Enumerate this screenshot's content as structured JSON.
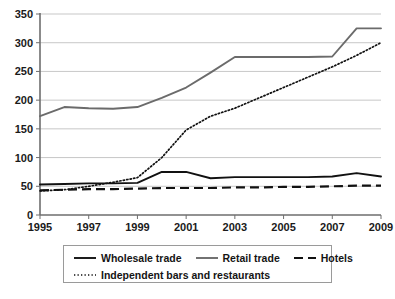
{
  "chart_data": {
    "type": "line",
    "title": "",
    "subtitle": "",
    "xlabel": "",
    "ylabel": "",
    "xlim": [
      1995,
      2009
    ],
    "ylim": [
      0,
      350
    ],
    "grid": true,
    "legend_position": "bottom",
    "x": [
      1995,
      1996,
      1997,
      1998,
      1999,
      2000,
      2001,
      2002,
      2003,
      2004,
      2005,
      2006,
      2007,
      2008,
      2009
    ],
    "y_ticks": [
      0,
      50,
      100,
      150,
      200,
      250,
      300,
      350
    ],
    "x_ticks": [
      1995,
      1997,
      1999,
      2001,
      2003,
      2005,
      2007,
      2009
    ],
    "x_tick_labels": [
      "1995",
      "1997",
      "1999",
      "2001",
      "2003",
      "2005",
      "2007",
      "2009"
    ],
    "y_tick_labels": [
      "0",
      "50",
      "100",
      "150",
      "200",
      "250",
      "300",
      "350"
    ],
    "series": [
      {
        "name": "Wholesale trade",
        "style": "solid",
        "color": "#111111",
        "values": [
          53,
          54,
          55,
          55,
          56,
          75,
          75,
          64,
          66,
          66,
          66,
          66,
          67,
          73,
          67
        ]
      },
      {
        "name": "Retail trade",
        "style": "solid",
        "color": "#6b6b6b",
        "values": [
          172,
          188,
          186,
          185,
          188,
          204,
          222,
          248,
          275,
          275,
          275,
          275,
          276,
          325,
          325
        ]
      },
      {
        "name": "Hotels",
        "style": "dashed",
        "color": "#111111",
        "values": [
          43,
          44,
          45,
          45,
          46,
          47,
          47,
          47,
          48,
          48,
          49,
          49,
          50,
          51,
          51
        ]
      },
      {
        "name": "Independent bars and restaurants",
        "style": "dotted",
        "color": "#111111",
        "values": [
          42,
          44,
          50,
          57,
          65,
          100,
          148,
          172,
          186,
          204,
          222,
          240,
          258,
          278,
          300
        ]
      }
    ]
  },
  "legend": {
    "entries": [
      {
        "label": "Wholesale trade",
        "icon": "solid-line-swatch"
      },
      {
        "label": "Retail trade",
        "icon": "solid-line-swatch"
      },
      {
        "label": "Hotels",
        "icon": "dashed-line-swatch"
      },
      {
        "label": "Independent bars and restaurants",
        "icon": "dotted-line-swatch"
      }
    ]
  }
}
